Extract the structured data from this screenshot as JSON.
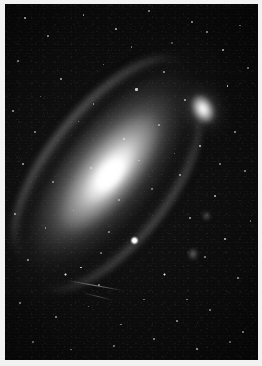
{
  "image": {
    "title": "Andromeda Galaxy (M31)",
    "kind": "astronomical-photograph",
    "palette": "grayscale",
    "width_px": 262,
    "height_px": 366,
    "border_color": "#f2f2f2",
    "sky_color": "#080808",
    "star_color": "#ffffff",
    "highlight_color": "#ffffff"
  },
  "objects": {
    "main_galaxy": {
      "name": "Andromeda Galaxy",
      "type": "spiral-galaxy",
      "center_x_pct": 42,
      "center_y_pct": 50,
      "major_axis_angle_deg": -51,
      "nucleus_label": "galactic-nucleus"
    },
    "companion_galaxy": {
      "name": "companion elliptical galaxy",
      "type": "elliptical-galaxy",
      "center_x_pct": 80,
      "center_y_pct": 30
    },
    "foreground_star": {
      "name": "bright foreground star",
      "center_x_pct": 52,
      "center_y_pct": 68
    },
    "satellite_streak": {
      "name": "diagonal trail",
      "center_x_pct": 34,
      "center_y_pct": 80
    },
    "dust_lanes": {
      "name": "dust lanes",
      "count": 4
    }
  },
  "stars": [
    {
      "x": 8,
      "y": 4,
      "r": 1.1,
      "b": 0.8
    },
    {
      "x": 17,
      "y": 9,
      "r": 0.8,
      "b": 0.55
    },
    {
      "x": 31,
      "y": 3,
      "r": 0.9,
      "b": 0.6
    },
    {
      "x": 44,
      "y": 7,
      "r": 1.0,
      "b": 0.72
    },
    {
      "x": 57,
      "y": 2,
      "r": 0.8,
      "b": 0.52
    },
    {
      "x": 66,
      "y": 11,
      "r": 1.2,
      "b": 0.85
    },
    {
      "x": 74,
      "y": 5,
      "r": 0.9,
      "b": 0.62
    },
    {
      "x": 86,
      "y": 13,
      "r": 1.0,
      "b": 0.7
    },
    {
      "x": 93,
      "y": 6,
      "r": 0.8,
      "b": 0.5
    },
    {
      "x": 5,
      "y": 16,
      "r": 0.9,
      "b": 0.58
    },
    {
      "x": 22,
      "y": 21,
      "r": 1.0,
      "b": 0.66
    },
    {
      "x": 39,
      "y": 17,
      "r": 0.8,
      "b": 0.48
    },
    {
      "x": 52,
      "y": 24,
      "r": 1.1,
      "b": 0.76
    },
    {
      "x": 63,
      "y": 19,
      "r": 0.9,
      "b": 0.58
    },
    {
      "x": 71,
      "y": 27,
      "r": 1.0,
      "b": 0.68
    },
    {
      "x": 88,
      "y": 23,
      "r": 1.2,
      "b": 0.82
    },
    {
      "x": 96,
      "y": 18,
      "r": 0.8,
      "b": 0.5
    },
    {
      "x": 3,
      "y": 30,
      "r": 1.0,
      "b": 0.64
    },
    {
      "x": 12,
      "y": 36,
      "r": 0.9,
      "b": 0.56
    },
    {
      "x": 29,
      "y": 33,
      "r": 0.8,
      "b": 0.46
    },
    {
      "x": 47,
      "y": 38,
      "r": 1.0,
      "b": 0.62
    },
    {
      "x": 61,
      "y": 34,
      "r": 0.9,
      "b": 0.54
    },
    {
      "x": 77,
      "y": 40,
      "r": 1.1,
      "b": 0.74
    },
    {
      "x": 91,
      "y": 36,
      "r": 0.9,
      "b": 0.58
    },
    {
      "x": 7,
      "y": 45,
      "r": 1.0,
      "b": 0.66
    },
    {
      "x": 19,
      "y": 50,
      "r": 0.8,
      "b": 0.48
    },
    {
      "x": 34,
      "y": 46,
      "r": 0.9,
      "b": 0.52
    },
    {
      "x": 58,
      "y": 52,
      "r": 0.8,
      "b": 0.46
    },
    {
      "x": 69,
      "y": 48,
      "r": 1.0,
      "b": 0.62
    },
    {
      "x": 83,
      "y": 54,
      "r": 1.1,
      "b": 0.72
    },
    {
      "x": 95,
      "y": 47,
      "r": 0.9,
      "b": 0.56
    },
    {
      "x": 4,
      "y": 59,
      "r": 1.0,
      "b": 0.64
    },
    {
      "x": 16,
      "y": 63,
      "r": 0.9,
      "b": 0.52
    },
    {
      "x": 27,
      "y": 58,
      "r": 0.8,
      "b": 0.44
    },
    {
      "x": 41,
      "y": 64,
      "r": 0.9,
      "b": 0.5
    },
    {
      "x": 73,
      "y": 60,
      "r": 1.0,
      "b": 0.64
    },
    {
      "x": 87,
      "y": 66,
      "r": 1.1,
      "b": 0.74
    },
    {
      "x": 97,
      "y": 61,
      "r": 0.8,
      "b": 0.48
    },
    {
      "x": 9,
      "y": 72,
      "r": 1.0,
      "b": 0.62
    },
    {
      "x": 24,
      "y": 76,
      "r": 1.3,
      "b": 0.9
    },
    {
      "x": 30,
      "y": 74,
      "r": 1.2,
      "b": 0.86
    },
    {
      "x": 37,
      "y": 79,
      "r": 0.9,
      "b": 0.52
    },
    {
      "x": 63,
      "y": 76,
      "r": 1.4,
      "b": 0.92
    },
    {
      "x": 79,
      "y": 71,
      "r": 0.9,
      "b": 0.54
    },
    {
      "x": 92,
      "y": 77,
      "r": 1.0,
      "b": 0.62
    },
    {
      "x": 6,
      "y": 84,
      "r": 0.9,
      "b": 0.54
    },
    {
      "x": 20,
      "y": 88,
      "r": 1.0,
      "b": 0.6
    },
    {
      "x": 33,
      "y": 85,
      "r": 0.8,
      "b": 0.46
    },
    {
      "x": 46,
      "y": 90,
      "r": 0.9,
      "b": 0.52
    },
    {
      "x": 55,
      "y": 83,
      "r": 0.8,
      "b": 0.44
    },
    {
      "x": 68,
      "y": 89,
      "r": 1.0,
      "b": 0.6
    },
    {
      "x": 81,
      "y": 86,
      "r": 0.9,
      "b": 0.52
    },
    {
      "x": 94,
      "y": 92,
      "r": 1.0,
      "b": 0.62
    },
    {
      "x": 11,
      "y": 95,
      "r": 0.9,
      "b": 0.5
    },
    {
      "x": 26,
      "y": 97,
      "r": 0.8,
      "b": 0.44
    },
    {
      "x": 43,
      "y": 96,
      "r": 0.9,
      "b": 0.52
    },
    {
      "x": 59,
      "y": 94,
      "r": 1.0,
      "b": 0.58
    },
    {
      "x": 76,
      "y": 97,
      "r": 1.1,
      "b": 0.7
    },
    {
      "x": 89,
      "y": 95,
      "r": 0.8,
      "b": 0.46
    },
    {
      "x": 50,
      "y": 12,
      "r": 0.8,
      "b": 0.46
    },
    {
      "x": 35,
      "y": 28,
      "r": 0.9,
      "b": 0.5
    },
    {
      "x": 80,
      "y": 8,
      "r": 1.0,
      "b": 0.62
    },
    {
      "x": 67,
      "y": 42,
      "r": 0.8,
      "b": 0.44
    },
    {
      "x": 45,
      "y": 55,
      "r": 0.9,
      "b": 0.5
    },
    {
      "x": 53,
      "y": 44,
      "r": 0.8,
      "b": 0.42
    },
    {
      "x": 14,
      "y": 26,
      "r": 0.8,
      "b": 0.44
    },
    {
      "x": 85,
      "y": 45,
      "r": 0.9,
      "b": 0.52
    },
    {
      "x": 72,
      "y": 83,
      "r": 0.9,
      "b": 0.5
    },
    {
      "x": 38,
      "y": 70,
      "r": 0.8,
      "b": 0.44
    }
  ]
}
